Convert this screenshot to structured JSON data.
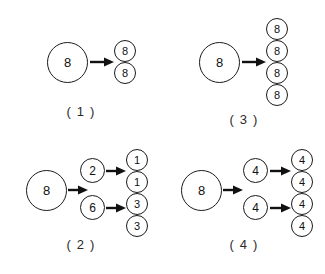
{
  "figure": {
    "title": "",
    "background_color": "#ffffff",
    "stroke_color": "#1a1a1a",
    "panel_count": 4
  },
  "panels": [
    {
      "id": "panel-1",
      "caption": "( 1 )",
      "source": {
        "value": "8",
        "size": "big"
      },
      "arrows": 1,
      "outputs": [
        {
          "value": "8",
          "size": "small"
        },
        {
          "value": "8",
          "size": "small"
        }
      ]
    },
    {
      "id": "panel-3",
      "caption": "( 3 )",
      "source": {
        "value": "8",
        "size": "big"
      },
      "arrows": 1,
      "outputs": [
        {
          "value": "8",
          "size": "small"
        },
        {
          "value": "8",
          "size": "small"
        },
        {
          "value": "8",
          "size": "small"
        },
        {
          "value": "8",
          "size": "small"
        }
      ]
    },
    {
      "id": "panel-2",
      "caption": "( 2 )",
      "source": {
        "value": "8",
        "size": "big"
      },
      "arrows": 3,
      "branches": [
        {
          "value": "2",
          "size": "mid",
          "outputs": [
            {
              "value": "1",
              "size": "small"
            },
            {
              "value": "1",
              "size": "small"
            }
          ]
        },
        {
          "value": "6",
          "size": "mid",
          "outputs": [
            {
              "value": "3",
              "size": "small"
            },
            {
              "value": "3",
              "size": "small"
            }
          ]
        }
      ]
    },
    {
      "id": "panel-4",
      "caption": "( 4 )",
      "source": {
        "value": "8",
        "size": "big"
      },
      "arrows": 3,
      "branches": [
        {
          "value": "4",
          "size": "mid",
          "outputs": [
            {
              "value": "4",
              "size": "small"
            },
            {
              "value": "4",
              "size": "small"
            }
          ]
        },
        {
          "value": "4",
          "size": "mid",
          "outputs": [
            {
              "value": "4",
              "size": "small"
            },
            {
              "value": "4",
              "size": "small"
            }
          ]
        }
      ]
    }
  ]
}
